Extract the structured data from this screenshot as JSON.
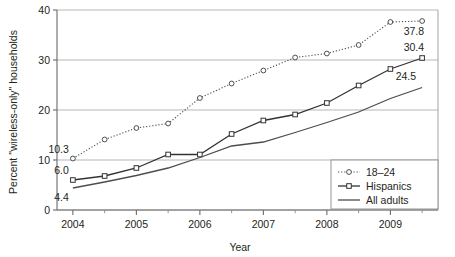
{
  "chart_data": {
    "type": "line",
    "title": "",
    "xlabel": "Year",
    "ylabel": "Percent \"wireless-only\" households",
    "xlim": [
      2003.75,
      2009.75
    ],
    "ylim": [
      0,
      40
    ],
    "yticks": [
      0,
      10,
      20,
      30,
      40
    ],
    "ytick_labels": [
      "0",
      "10",
      "20",
      "30",
      "40"
    ],
    "xticks": [
      2004,
      2005,
      2006,
      2007,
      2008,
      2009
    ],
    "xtick_labels": [
      "2004",
      "2005",
      "2006",
      "2007",
      "2008",
      "2009"
    ],
    "xminor_ticks": [
      2004.5,
      2005.5,
      2006.5,
      2007.5,
      2008.5,
      2009.5
    ],
    "grid": "horizontal",
    "legend_position": "bottom-right",
    "x": [
      2004,
      2004.5,
      2005,
      2005.5,
      2006,
      2006.5,
      2007,
      2007.5,
      2008,
      2008.5,
      2009,
      2009.5
    ],
    "series": [
      {
        "name": "18–24",
        "style": "dotted",
        "marker": "open-circle",
        "color": "#4d4d4d",
        "values": [
          10.3,
          14.1,
          16.4,
          17.3,
          22.4,
          25.3,
          27.9,
          30.5,
          31.3,
          33.0,
          37.6,
          37.8
        ],
        "start_label": "10.3",
        "end_label": "37.8"
      },
      {
        "name": "Hispanics",
        "style": "solid",
        "marker": "open-square",
        "color": "#333333",
        "values": [
          6.0,
          6.8,
          8.4,
          11.1,
          11.1,
          15.2,
          17.9,
          19.1,
          21.4,
          24.9,
          28.2,
          30.4
        ],
        "start_label": "6.0",
        "end_label": "30.4"
      },
      {
        "name": "All adults",
        "style": "solid",
        "marker": "none",
        "color": "#4d4d4d",
        "values": [
          4.4,
          5.6,
          6.9,
          8.4,
          10.5,
          12.8,
          13.6,
          15.5,
          17.5,
          19.6,
          22.3,
          24.5
        ],
        "start_label": "4.4",
        "end_label": "24.5"
      }
    ],
    "annotations": [
      {
        "text": "10.3",
        "series": "18–24",
        "position": "left"
      },
      {
        "text": "6.0",
        "series": "Hispanics",
        "position": "left"
      },
      {
        "text": "4.4",
        "series": "All adults",
        "position": "left"
      },
      {
        "text": "37.8",
        "series": "18–24",
        "position": "right"
      },
      {
        "text": "30.4",
        "series": "Hispanics",
        "position": "right"
      },
      {
        "text": "24.5",
        "series": "All adults",
        "position": "right"
      }
    ]
  },
  "legend": {
    "items": [
      {
        "label": "18–24"
      },
      {
        "label": "Hispanics"
      },
      {
        "label": "All adults"
      }
    ]
  }
}
